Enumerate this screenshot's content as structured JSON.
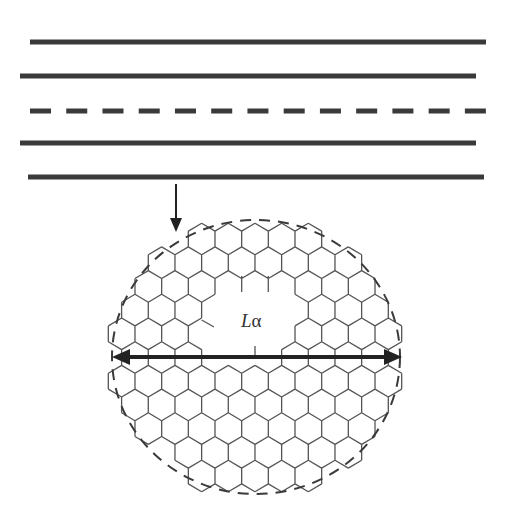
{
  "diagram": {
    "colors": {
      "line": "#3a3a3a",
      "hex": "#555555",
      "arrow": "#222222",
      "background": "#ffffff"
    },
    "layers": [
      {
        "id": "layer-1",
        "style": "solid",
        "y": 42,
        "x1": 30,
        "x2": 486
      },
      {
        "id": "layer-2",
        "style": "solid",
        "y": 76,
        "x1": 20,
        "x2": 476
      },
      {
        "id": "layer-3",
        "style": "dashed",
        "y": 111,
        "x1": 30,
        "x2": 486,
        "dash_count": 13
      },
      {
        "id": "layer-4",
        "style": "solid",
        "y": 143,
        "x1": 20,
        "x2": 476
      },
      {
        "id": "layer-5",
        "style": "solid",
        "y": 177,
        "x1": 28,
        "x2": 484
      }
    ],
    "pointer_arrow": {
      "x": 176,
      "y1": 184,
      "y2": 232
    },
    "domain_circle": {
      "cx": 256,
      "cy": 357,
      "rx": 144,
      "ry": 137,
      "style": "dashed"
    },
    "hex_grid": {
      "orientation": "pointy-top",
      "width": 26.67,
      "row_spacing": 23.7,
      "first_row_y": 239,
      "even_row_origin_x": 255,
      "odd_row_origin_x": 268.3,
      "rows": 11,
      "fill_rx": 137,
      "fill_ry": 131,
      "hole_cells": [
        [
          2,
          -1
        ],
        [
          2,
          0
        ],
        [
          2,
          1
        ],
        [
          3,
          -2
        ],
        [
          3,
          -1
        ],
        [
          3,
          0
        ],
        [
          3,
          1
        ],
        [
          4,
          -2
        ],
        [
          4,
          -1
        ],
        [
          4,
          0
        ],
        [
          4,
          1
        ],
        [
          5,
          -2
        ],
        [
          5,
          -1
        ],
        [
          5,
          0
        ]
      ]
    },
    "diameter_arrow": {
      "y": 357,
      "x1": 112,
      "x2": 402
    },
    "label": {
      "symbol": "L",
      "subscript": "α",
      "x": 241,
      "y": 310
    }
  }
}
